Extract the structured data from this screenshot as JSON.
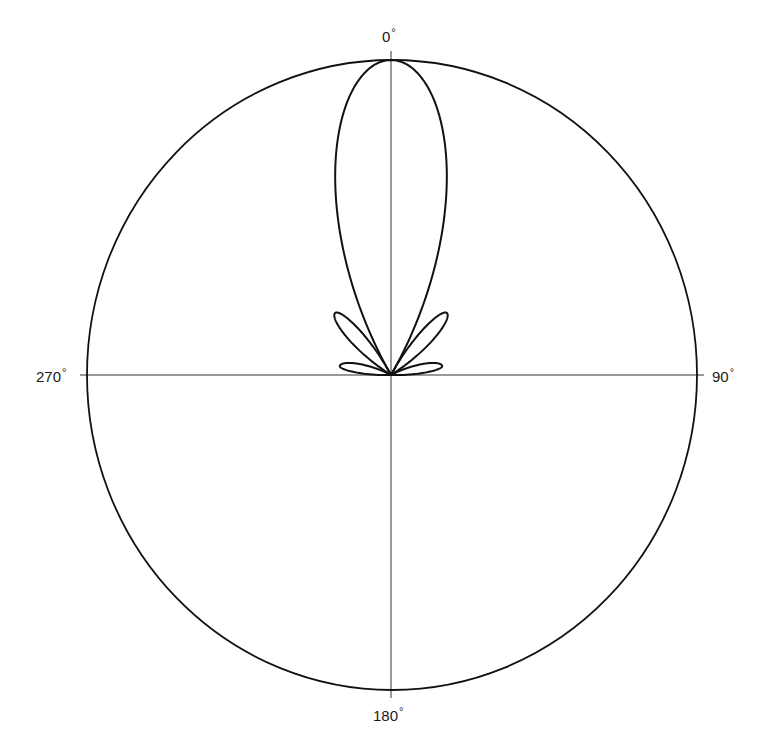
{
  "chart_data": {
    "type": "polar",
    "title": "",
    "angle_labels": [
      {
        "angle": 0,
        "text": "0"
      },
      {
        "angle": 90,
        "text": "90"
      },
      {
        "angle": 180,
        "text": "180"
      },
      {
        "angle": 270,
        "text": "270"
      }
    ],
    "degree_symbol": "°",
    "axes": {
      "horizontal": true,
      "vertical": true
    },
    "outer_circle": {
      "relative_radius": 1.0
    },
    "lobes": [
      {
        "name": "main",
        "start_deg": -30,
        "end_deg": 30,
        "peak_deg": 0,
        "peak_r": 1.0,
        "exponent": 1.1
      },
      {
        "name": "sidelobe-1-right",
        "start_deg": 28,
        "end_deg": 58,
        "peak_deg": 42,
        "peak_r": 0.265,
        "exponent": 1.2
      },
      {
        "name": "sidelobe-1-left",
        "start_deg": -58,
        "end_deg": -28,
        "peak_deg": -42,
        "peak_r": 0.265,
        "exponent": 1.2
      },
      {
        "name": "sidelobe-2-right",
        "start_deg": 62,
        "end_deg": 92,
        "peak_deg": 80,
        "peak_r": 0.165,
        "exponent": 1.2
      },
      {
        "name": "sidelobe-2-left",
        "start_deg": -92,
        "end_deg": -62,
        "peak_deg": -80,
        "peak_r": 0.165,
        "exponent": 1.2
      }
    ],
    "style": {
      "line_color": "#111111",
      "axis_color": "#333333"
    }
  },
  "labels": {
    "top": "0",
    "right": "90",
    "bottom": "180",
    "left": "270",
    "degree": "°"
  }
}
